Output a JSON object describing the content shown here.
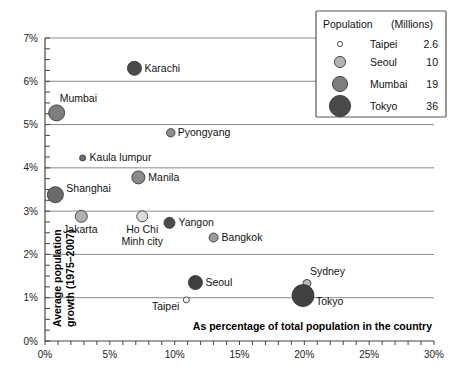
{
  "chart_data": {
    "type": "scatter",
    "title": "",
    "xlabel": "As percentage of total population in the country",
    "ylabel": "Average population growth (1975–2007)",
    "ylabel_line1": "Average population",
    "ylabel_line2": "growth (1975–2007)",
    "xlim": [
      0,
      30
    ],
    "ylim": [
      0,
      7
    ],
    "x_ticks": [
      "0%",
      "5%",
      "10%",
      "15%",
      "20%",
      "25%",
      "30%"
    ],
    "x_tick_values": [
      0,
      5,
      10,
      15,
      20,
      25,
      30
    ],
    "y_ticks": [
      "0%",
      "1%",
      "2%",
      "3%",
      "4%",
      "5%",
      "6%",
      "7%"
    ],
    "y_tick_values": [
      0,
      1,
      2,
      3,
      4,
      5,
      6,
      7
    ],
    "x_minor_step": 1,
    "y_minor_step": 0.25,
    "grid": true,
    "grid_axis": "y",
    "size_unit": "millions",
    "points": [
      {
        "name": "Karachi",
        "x": 6.9,
        "y": 6.3,
        "r": 7.0,
        "color": "#4a4a4a",
        "label_dx": 10,
        "label_dy": 3.5,
        "anchor": "start"
      },
      {
        "name": "Mumbai",
        "x": 0.9,
        "y": 5.27,
        "r": 8.0,
        "color": "#7d7d7d",
        "label_dx": 3,
        "label_dy": -11,
        "anchor": "start"
      },
      {
        "name": "Pyongyang",
        "x": 9.7,
        "y": 4.81,
        "r": 4.2,
        "color": "#8f8f8f",
        "label_dx": 7,
        "label_dy": 3.5,
        "anchor": "start"
      },
      {
        "name": "Kaula lumpur",
        "x": 2.9,
        "y": 4.23,
        "r": 3.0,
        "color": "#6e6e6e",
        "label_dx": 7,
        "label_dy": 3.5,
        "anchor": "start"
      },
      {
        "name": "Manila",
        "x": 7.2,
        "y": 3.78,
        "r": 6.5,
        "color": "#8a8a8a",
        "label_dx": 10,
        "label_dy": 3.5,
        "anchor": "start"
      },
      {
        "name": "Shanghai",
        "x": 0.8,
        "y": 3.38,
        "r": 8.0,
        "color": "#6b6b6b",
        "label_dx": 11,
        "label_dy": -3,
        "anchor": "start"
      },
      {
        "name": "Jakarta",
        "x": 2.8,
        "y": 2.88,
        "r": 6.0,
        "color": "#b0b0b0",
        "label_dx": -1,
        "label_dy": 17,
        "anchor": "middle"
      },
      {
        "name": "Yangon",
        "x": 9.6,
        "y": 2.73,
        "r": 5.5,
        "color": "#4a4a4a",
        "label_dx": 9,
        "label_dy": 3.5,
        "anchor": "start"
      },
      {
        "name": "Bangkok",
        "x": 13.0,
        "y": 2.39,
        "r": 4.5,
        "color": "#9a9a9a",
        "label_dx": 8,
        "label_dy": 3.5,
        "anchor": "start"
      },
      {
        "name": "Seoul",
        "x": 11.6,
        "y": 1.35,
        "r": 7.0,
        "color": "#3f3f3f",
        "label_dx": 10,
        "label_dy": 3.5,
        "anchor": "start"
      },
      {
        "name": "Sydney",
        "x": 20.2,
        "y": 1.33,
        "r": 4.0,
        "color": "#b8b8b8",
        "label_dx": 3,
        "label_dy": -8,
        "anchor": "start"
      },
      {
        "name": "Tokyo",
        "x": 19.9,
        "y": 1.05,
        "r": 11.0,
        "color": "#414141",
        "label_dx": 13,
        "label_dy": 9,
        "anchor": "start"
      },
      {
        "name": "Taipei",
        "x": 10.9,
        "y": 0.95,
        "r": 3.0,
        "color": "#f2f2f2",
        "label_dx": -7,
        "label_dy": 10,
        "anchor": "end"
      }
    ],
    "multiline_points": [
      {
        "name": "Ho Chi Minh city",
        "x": 7.5,
        "y": 2.88,
        "r": 5.5,
        "color": "#dcdcdc",
        "label_line1": "Ho Chi",
        "label_line2": "Minh city",
        "label_dx": 0,
        "label_dy": 17
      }
    ]
  },
  "legend": {
    "title": "Population",
    "unit": "(Millions)",
    "entries": [
      {
        "label": "Taipei",
        "value": "2.6",
        "r": 2.6,
        "color": "#fbfbfb"
      },
      {
        "label": "Seoul",
        "value": "10",
        "r": 5.6,
        "color": "#b4b4b4"
      },
      {
        "label": "Mumbai",
        "value": "19",
        "r": 7.6,
        "color": "#7e7e7e"
      },
      {
        "label": "Tokyo",
        "value": "36",
        "r": 10.6,
        "color": "#4a4a4a"
      }
    ]
  },
  "colors": {
    "grid": "#8a8a8a",
    "axis": "#444444",
    "text": "#111111",
    "background": "#ffffff"
  }
}
